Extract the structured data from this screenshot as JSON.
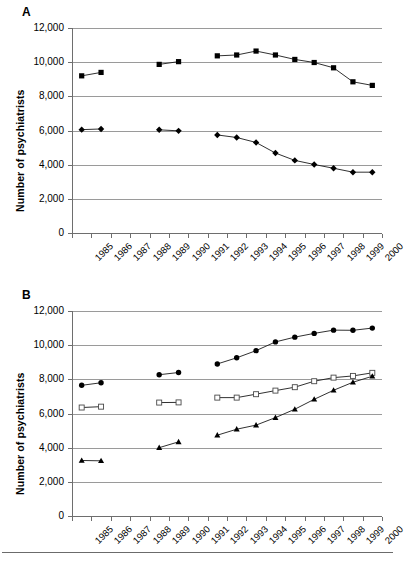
{
  "figure": {
    "bottom_rule": true,
    "panels": [
      {
        "letter": "A",
        "ylabel": "Number of psychiatrists",
        "ytick_labels": [
          "12,000",
          "10,000",
          "8,000",
          "6,000",
          "4,000",
          "2,000",
          "0"
        ]
      },
      {
        "letter": "B",
        "ylabel": "Number of psychiatrists",
        "ytick_labels": [
          "12,000",
          "10,000",
          "8,000",
          "6,000",
          "4,000",
          "2,000",
          "0"
        ]
      }
    ]
  },
  "chart_data": [
    {
      "panel": "A",
      "type": "line",
      "title": "A",
      "xlabel": "",
      "ylabel": "Number of psychiatrists",
      "x": [
        "1985",
        "1986",
        "1987",
        "1988",
        "1989",
        "1990",
        "1991",
        "1992",
        "1993",
        "1994",
        "1995",
        "1996",
        "1997",
        "1998",
        "1999",
        "2000"
      ],
      "xtick_labels": [
        "1985",
        "1986",
        "1987",
        "1988",
        "1989",
        "1990",
        "1991",
        "1992",
        "1993",
        "1994",
        "1995",
        "1996",
        "1997",
        "1998",
        "1999",
        "2000"
      ],
      "ylim": [
        0,
        12000
      ],
      "ytick_values": [
        12000,
        10000,
        8000,
        6000,
        4000,
        2000,
        0
      ],
      "grid": "horizontal",
      "legend": "none",
      "series": [
        {
          "name": "upper-series",
          "marker": "filled-square",
          "values": [
            9200,
            9400,
            null,
            null,
            9870,
            10030,
            null,
            10370,
            10420,
            10650,
            10420,
            10160,
            9980,
            9670,
            8850,
            8640
          ]
        },
        {
          "name": "lower-series",
          "marker": "filled-diamond",
          "values": [
            6050,
            6090,
            null,
            null,
            6040,
            5980,
            null,
            5740,
            5590,
            5300,
            4680,
            4250,
            4010,
            3790,
            3560,
            3560
          ]
        }
      ]
    },
    {
      "panel": "B",
      "type": "line",
      "title": "B",
      "xlabel": "",
      "ylabel": "Number of psychiatrists",
      "x": [
        "1985",
        "1986",
        "1987",
        "1988",
        "1989",
        "1990",
        "1991",
        "1992",
        "1993",
        "1994",
        "1995",
        "1996",
        "1997",
        "1998",
        "1999",
        "2000"
      ],
      "xtick_labels": [
        "1985",
        "1986",
        "1987",
        "1988",
        "1989",
        "1990",
        "1991",
        "1992",
        "1993",
        "1994",
        "1995",
        "1996",
        "1997",
        "1998",
        "1999",
        "2000"
      ],
      "ylim": [
        0,
        12000
      ],
      "ytick_values": [
        12000,
        10000,
        8000,
        6000,
        4000,
        2000,
        0
      ],
      "grid": "horizontal",
      "legend": "none",
      "series": [
        {
          "name": "circle-series",
          "marker": "filled-circle",
          "values": [
            7650,
            7800,
            null,
            null,
            8270,
            8400,
            null,
            8900,
            9260,
            9680,
            10190,
            10470,
            10690,
            10880,
            10870,
            11000
          ]
        },
        {
          "name": "open-square-series",
          "marker": "open-square",
          "values": [
            6350,
            6400,
            null,
            null,
            6640,
            6650,
            null,
            6930,
            6930,
            7130,
            7340,
            7540,
            7890,
            8100,
            8200,
            8380
          ]
        },
        {
          "name": "triangle-series",
          "marker": "filled-triangle",
          "values": [
            3250,
            3230,
            null,
            null,
            4000,
            4340,
            null,
            4730,
            5080,
            5320,
            5760,
            6250,
            6830,
            7360,
            7830,
            8180
          ]
        }
      ]
    }
  ]
}
